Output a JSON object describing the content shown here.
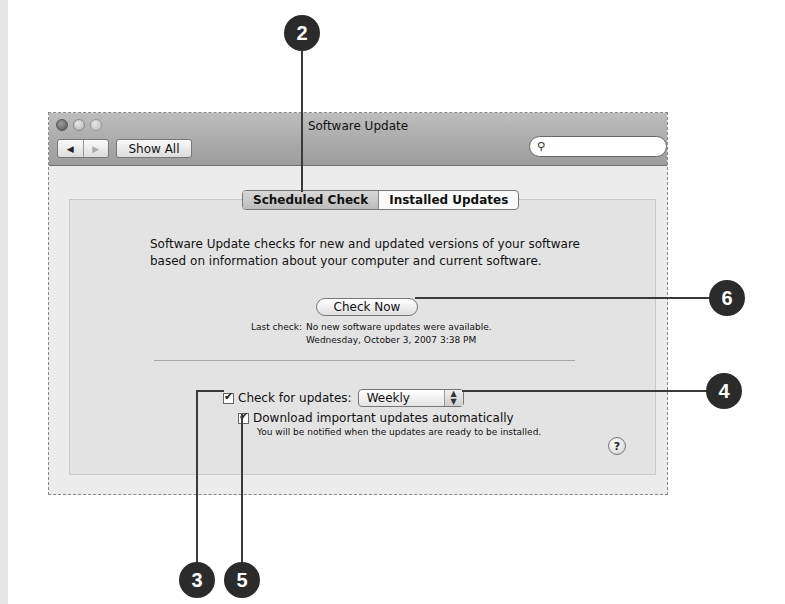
{
  "window": {
    "title": "Software Update",
    "toolbar": {
      "back_label": "◀",
      "forward_label": "▶",
      "show_all_label": "Show All",
      "search_placeholder": "",
      "search_icon": "search-icon"
    }
  },
  "tabs": [
    {
      "label": "Scheduled Check",
      "active": true
    },
    {
      "label": "Installed Updates",
      "active": false
    }
  ],
  "main": {
    "description": "Software Update checks for new and updated versions of your software based on information about your computer and current software.",
    "check_now_label": "Check Now",
    "last_check_label": "Last check:",
    "last_check_status": "No new software updates were available.",
    "last_check_date": "Wednesday, October 3, 2007 3:38 PM",
    "check_for_updates": {
      "label": "Check for updates:",
      "checked": true,
      "frequency": "Weekly"
    },
    "download_auto": {
      "label": "Download important updates automatically",
      "checked": true
    },
    "note": "You will be notified when the updates are ready to be installed.",
    "help_label": "?"
  },
  "callouts": [
    {
      "number": "2",
      "target": "scheduled-check-tab"
    },
    {
      "number": "3",
      "target": "check-for-updates-checkbox"
    },
    {
      "number": "4",
      "target": "frequency-popup"
    },
    {
      "number": "5",
      "target": "download-automatically-checkbox"
    },
    {
      "number": "6",
      "target": "check-now-button"
    }
  ]
}
